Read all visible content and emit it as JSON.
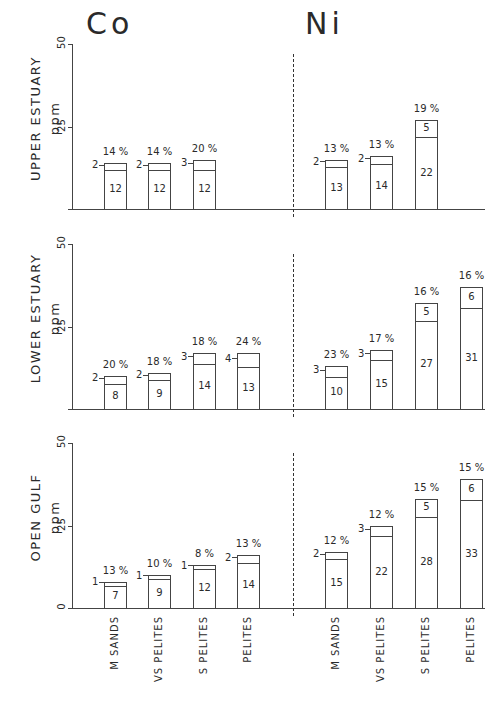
{
  "titles": {
    "left": "Co",
    "right": "Ni"
  },
  "y_unit": "ppm",
  "y_ticks": [
    "0",
    "25",
    "50"
  ],
  "categories": [
    "M SANDS",
    "VS PELITES",
    "S PELITES",
    "PELITES"
  ],
  "rows": [
    {
      "label": "UPPER ESTUARY",
      "co": [
        {
          "category": "M SANDS",
          "base": 12,
          "extra": 2,
          "pct": "14 %"
        },
        {
          "category": "VS PELITES",
          "base": 12,
          "extra": 2,
          "pct": "14 %"
        },
        {
          "category": "S PELITES",
          "base": 12,
          "extra": 3,
          "pct": "20 %"
        }
      ],
      "ni": [
        {
          "category": "M SANDS",
          "base": 13,
          "extra": 2,
          "pct": "13 %"
        },
        {
          "category": "VS PELITES",
          "base": 14,
          "extra": 2,
          "pct": "13 %"
        },
        {
          "category": "S PELITES",
          "base": 22,
          "extra": 5,
          "pct": "19 %"
        }
      ]
    },
    {
      "label": "LOWER ESTUARY",
      "co": [
        {
          "category": "M SANDS",
          "base": 8,
          "extra": 2,
          "pct": "20 %"
        },
        {
          "category": "VS PELITES",
          "base": 9,
          "extra": 2,
          "pct": "18 %"
        },
        {
          "category": "S PELITES",
          "base": 14,
          "extra": 3,
          "pct": "18 %"
        },
        {
          "category": "PELITES",
          "base": 13,
          "extra": 4,
          "pct": "24 %"
        }
      ],
      "ni": [
        {
          "category": "M SANDS",
          "base": 10,
          "extra": 3,
          "pct": "23 %"
        },
        {
          "category": "VS PELITES",
          "base": 15,
          "extra": 3,
          "pct": "17 %"
        },
        {
          "category": "S PELITES",
          "base": 27,
          "extra": 5,
          "pct": "16 %"
        },
        {
          "category": "PELITES",
          "base": 31,
          "extra": 6,
          "pct": "16 %"
        }
      ]
    },
    {
      "label": "OPEN GULF",
      "co": [
        {
          "category": "M SANDS",
          "base": 7,
          "extra": 1,
          "pct": "13 %"
        },
        {
          "category": "VS PELITES",
          "base": 9,
          "extra": 1,
          "pct": "10 %"
        },
        {
          "category": "S PELITES",
          "base": 12,
          "extra": 1,
          "pct": "8 %"
        },
        {
          "category": "PELITES",
          "base": 14,
          "extra": 2,
          "pct": "13 %"
        }
      ],
      "ni": [
        {
          "category": "M SANDS",
          "base": 15,
          "extra": 2,
          "pct": "12 %"
        },
        {
          "category": "VS PELITES",
          "base": 22,
          "extra": 3,
          "pct": "12 %"
        },
        {
          "category": "S PELITES",
          "base": 28,
          "extra": 5,
          "pct": "15 %"
        },
        {
          "category": "PELITES",
          "base": 33,
          "extra": 6,
          "pct": "15 %"
        }
      ]
    }
  ],
  "chart_data": {
    "type": "bar",
    "ylabel": "ppm",
    "ylim": [
      0,
      50
    ],
    "y_ticks": [
      0,
      25,
      50
    ],
    "grid": false,
    "stacked": true,
    "note": "Each bar = lower fraction (base, labelled inside) + upper fraction (extra, labelled or leader-line); percentage shown above bar",
    "categories": [
      "M SANDS",
      "VS PELITES",
      "S PELITES",
      "PELITES"
    ],
    "panels": [
      {
        "row": "UPPER ESTUARY",
        "element": "Co",
        "series": [
          {
            "name": "base",
            "values": [
              12,
              12,
              12,
              null
            ]
          },
          {
            "name": "extra",
            "values": [
              2,
              2,
              3,
              null
            ]
          }
        ],
        "percent": [
          "14 %",
          "14 %",
          "20 %",
          null
        ]
      },
      {
        "row": "UPPER ESTUARY",
        "element": "Ni",
        "series": [
          {
            "name": "base",
            "values": [
              13,
              14,
              22,
              null
            ]
          },
          {
            "name": "extra",
            "values": [
              2,
              2,
              5,
              null
            ]
          }
        ],
        "percent": [
          "13 %",
          "13 %",
          "19 %",
          null
        ]
      },
      {
        "row": "LOWER ESTUARY",
        "element": "Co",
        "series": [
          {
            "name": "base",
            "values": [
              8,
              9,
              14,
              13
            ]
          },
          {
            "name": "extra",
            "values": [
              2,
              2,
              3,
              4
            ]
          }
        ],
        "percent": [
          "20 %",
          "18 %",
          "18 %",
          "24 %"
        ]
      },
      {
        "row": "LOWER ESTUARY",
        "element": "Ni",
        "series": [
          {
            "name": "base",
            "values": [
              10,
              15,
              27,
              31
            ]
          },
          {
            "name": "extra",
            "values": [
              3,
              3,
              5,
              6
            ]
          }
        ],
        "percent": [
          "23 %",
          "17 %",
          "16 %",
          "16 %"
        ]
      },
      {
        "row": "OPEN GULF",
        "element": "Co",
        "series": [
          {
            "name": "base",
            "values": [
              7,
              9,
              12,
              14
            ]
          },
          {
            "name": "extra",
            "values": [
              1,
              1,
              1,
              2
            ]
          }
        ],
        "percent": [
          "13 %",
          "10 %",
          "8 %",
          "13 %"
        ]
      },
      {
        "row": "OPEN GULF",
        "element": "Ni",
        "series": [
          {
            "name": "base",
            "values": [
              15,
              22,
              28,
              33
            ]
          },
          {
            "name": "extra",
            "values": [
              2,
              3,
              5,
              6
            ]
          }
        ],
        "percent": [
          "12 %",
          "12 %",
          "15 %",
          "15 %"
        ]
      }
    ]
  }
}
